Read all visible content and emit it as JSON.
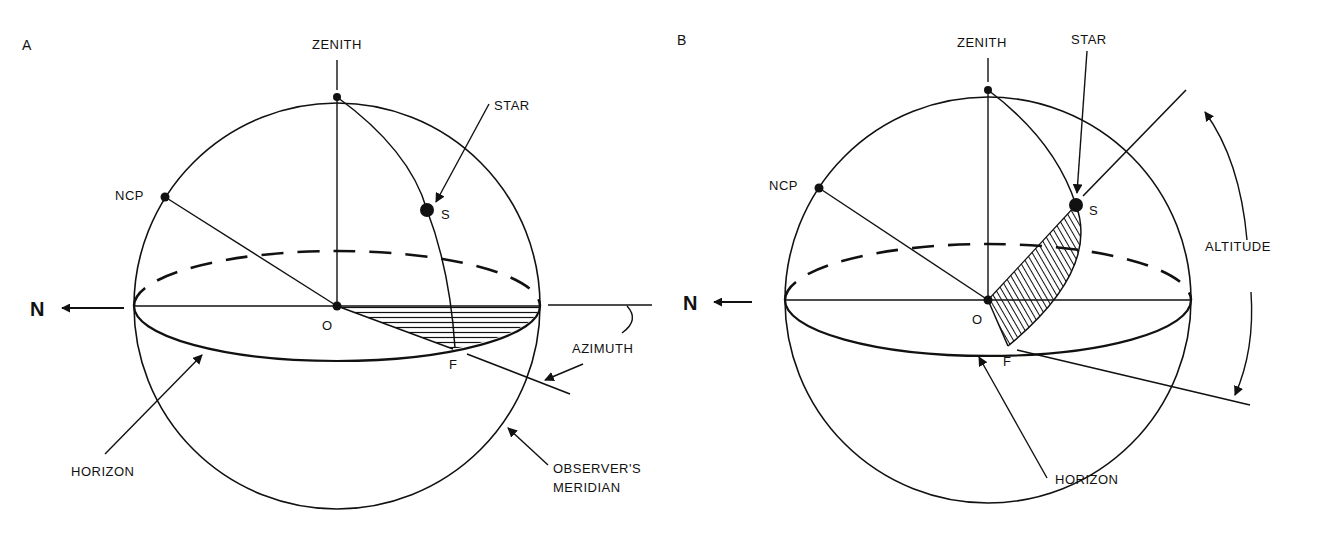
{
  "diagrams": [
    {
      "panel_label": "A",
      "labels": {
        "zenith": "ZENITH",
        "star": "STAR",
        "ncp": "NCP",
        "s": "S",
        "o": "O",
        "f": "F",
        "north": "N",
        "azimuth": "AZIMUTH",
        "horizon": "HORIZON",
        "meridian_line1": "OBSERVER'S",
        "meridian_line2": "MERIDIAN"
      },
      "shaded_region": "azimuth",
      "hatch_style": "horizontal"
    },
    {
      "panel_label": "B",
      "labels": {
        "zenith": "ZENITH",
        "star": "STAR",
        "ncp": "NCP",
        "s": "S",
        "o": "O",
        "f": "F",
        "north": "N",
        "altitude": "ALTITUDE",
        "horizon": "HORIZON"
      },
      "shaded_region": "altitude",
      "hatch_style": "diagonal"
    }
  ],
  "colors": {
    "ink": "#111111",
    "background": "#ffffff"
  }
}
